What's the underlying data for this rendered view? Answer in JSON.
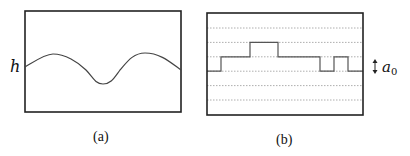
{
  "panels": [
    {
      "id": "a",
      "caption": "(a)",
      "axis_label": "h",
      "description": "smooth height profile h(x): two humps with a dip in between"
    },
    {
      "id": "b",
      "caption": "(b)",
      "step_label_base": "a",
      "step_label_sub": "0",
      "description": "discretized step profile on lattice levels spaced by a0",
      "levels_count": 6,
      "step_profile_levels": [
        3,
        2,
        1,
        2,
        3,
        2,
        3
      ]
    }
  ]
}
